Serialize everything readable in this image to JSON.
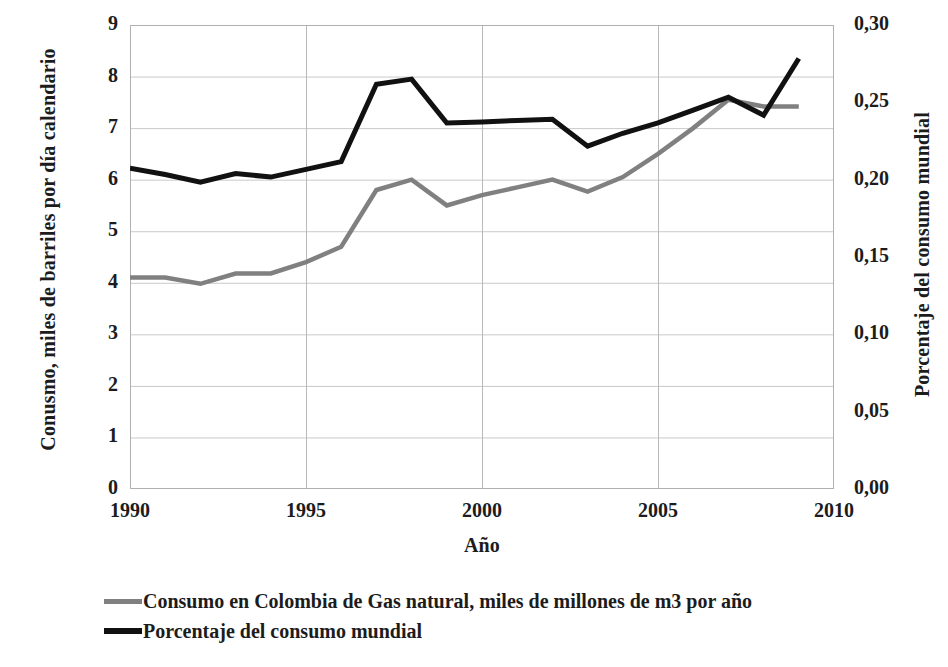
{
  "chart_data": {
    "type": "line",
    "title": "",
    "xlabel": "Año",
    "ylabel": "Conusmo, miles de barriles por día calendario",
    "ylabel_right": "Porcentaje del consumo mundial",
    "grid": true,
    "legend_position": "bottom-left",
    "xlim": [
      1990,
      2010
    ],
    "ylim": [
      0,
      9
    ],
    "ylim_right": [
      0.0,
      0.3
    ],
    "xticks": [
      "1990",
      "1995",
      "2000",
      "2005",
      "2010"
    ],
    "xtick_values": [
      1990,
      1995,
      2000,
      2005,
      2010
    ],
    "yticks_left": [
      "0",
      "1",
      "2",
      "3",
      "4",
      "5",
      "6",
      "7",
      "8",
      "9"
    ],
    "ytick_values_left": [
      0,
      1,
      2,
      3,
      4,
      5,
      6,
      7,
      8,
      9
    ],
    "yticks_right": [
      "0,00",
      "0,05",
      "0,10",
      "0,15",
      "0,20",
      "0,25",
      "0,30"
    ],
    "ytick_values_right": [
      0.0,
      0.05,
      0.1,
      0.15,
      0.2,
      0.25,
      0.3
    ],
    "x": [
      1990,
      1991,
      1992,
      1993,
      1994,
      1995,
      1996,
      1997,
      1998,
      1999,
      2000,
      2001,
      2002,
      2003,
      2004,
      2005,
      2006,
      2007,
      2008,
      2009
    ],
    "series": [
      {
        "name": "Consumo en Colombia de Gas natural, miles de millones de m3 por año",
        "color": "#808080",
        "axis": "left",
        "values": [
          4.1,
          4.1,
          3.98,
          4.18,
          4.18,
          4.4,
          4.7,
          5.8,
          6.0,
          5.5,
          5.7,
          5.85,
          6.0,
          5.77,
          6.05,
          6.5,
          7.0,
          7.55,
          7.42,
          7.42
        ]
      },
      {
        "name": "Porcentaje del consumo mundial",
        "color": "#111111",
        "axis": "left",
        "values": [
          6.22,
          6.1,
          5.95,
          6.12,
          6.05,
          6.2,
          6.35,
          7.85,
          7.95,
          7.1,
          7.12,
          7.15,
          7.17,
          6.65,
          6.9,
          7.1,
          7.35,
          7.6,
          7.25,
          8.35
        ]
      }
    ],
    "series_right_scale": [
      {
        "name": "Porcentaje del consumo mundial",
        "values": [
          0.207,
          0.203,
          0.198,
          0.204,
          0.202,
          0.207,
          0.212,
          0.262,
          0.265,
          0.237,
          0.237,
          0.238,
          0.239,
          0.222,
          0.23,
          0.237,
          0.245,
          0.253,
          0.242,
          0.278
        ]
      }
    ]
  },
  "legend": {
    "items": [
      {
        "label": "Consumo en Colombia de Gas natural, miles de millones de m3 por año",
        "swatch": "gray"
      },
      {
        "label": "Porcentaje del consumo mundial",
        "swatch": "black"
      }
    ]
  }
}
